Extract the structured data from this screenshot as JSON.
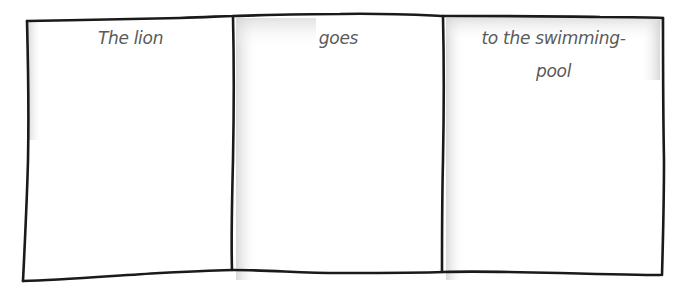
{
  "diagram": {
    "type": "sentence-strip",
    "panels": [
      {
        "id": "subject",
        "text": "The lion"
      },
      {
        "id": "verb",
        "text": "goes"
      },
      {
        "id": "place",
        "line1": "to the swimming-",
        "line2": "pool"
      }
    ],
    "colors": {
      "line": "#1a1a1a",
      "text": "#5a5a5a",
      "shade": "#d8d8d8",
      "background": "#ffffff"
    }
  }
}
